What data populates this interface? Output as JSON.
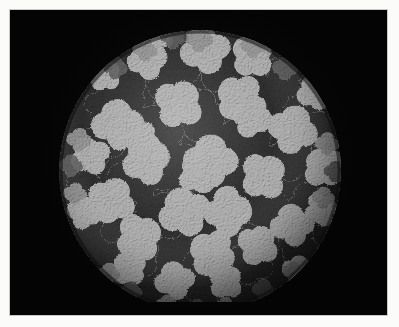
{
  "figure": {
    "kind": "molecular-surface-render",
    "subject": "icosahedral virus capsid",
    "background_color": "#040404",
    "page_color": "#fbfbfa",
    "frame_line_color": "#c9c9c9",
    "alt_text": "Space-filling surface rendering of a spherical icosahedral virus capsid on a black background, showing light-gray and dark-gray protein subunits arranged in trimer and pentamer clusters."
  },
  "palette": {
    "subunit_light": "#b2b2b2",
    "subunit_light_shadow": "#8e8e8e",
    "subunit_dark": "#262626",
    "subunit_dark_shadow": "#141414",
    "subunit_mid": "#6d6d6d",
    "rim_dark": "#0c0c0c",
    "specular": "#d6d6d6"
  },
  "geometry": {
    "center_x": 197,
    "center_y": 161,
    "radius": 141,
    "plate_left": 9,
    "plate_top": 9,
    "plate_width": 379,
    "plate_height": 307,
    "image_width": 399,
    "image_height": 327
  },
  "structure": {
    "symmetry": "icosahedral",
    "light_cluster_count": 31,
    "dark_cluster_count": 28,
    "surface_texture": "granular space-filling atoms"
  },
  "labels": {
    "title": "",
    "caption": "",
    "scale_bar": ""
  }
}
